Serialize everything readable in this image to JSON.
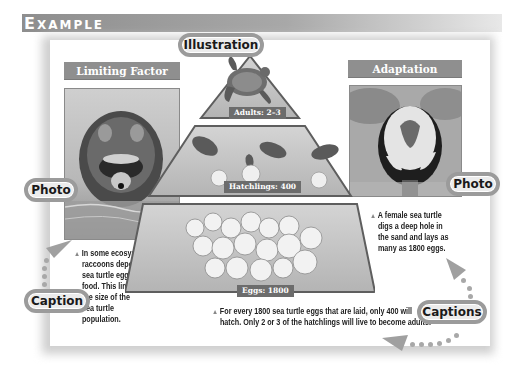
{
  "header": {
    "title_first": "E",
    "title_rest": "XAMPLE"
  },
  "callouts": {
    "illustration": "Illustration",
    "photo_left": "Photo",
    "photo_right": "Photo",
    "caption": "Caption",
    "captions": "Captions"
  },
  "panels": {
    "left": {
      "label": "Limiting Factor",
      "image": "raccoon-photo",
      "caption_lines": [
        "In some ecosystems,",
        "raccoons depend on",
        "sea turtle eggs for",
        "food. This limits",
        "the size of the",
        "sea turtle",
        "population."
      ]
    },
    "right": {
      "label": "Adaptation",
      "image": "sea-turtle-nesting-photo",
      "caption_lines": [
        "A female sea turtle",
        "digs a deep hole in",
        "the sand and lays as",
        "many as 1800 eggs."
      ]
    }
  },
  "pyramid": {
    "tiers": [
      {
        "label": "Adults: 2–3",
        "image": "adult-turtle"
      },
      {
        "label": "Hatchlings: 400",
        "image": "hatchling-turtles"
      },
      {
        "label": "Eggs: 1800",
        "image": "turtle-eggs"
      }
    ],
    "caption_lines": [
      "For every 1800 sea turtle eggs that are laid, only 400 will",
      "hatch. Only 2 or 3 of the hatchlings will live to become adults."
    ]
  },
  "colors": {
    "header_band": "#8e8e8e",
    "pill_border": "#9b9b9b",
    "label_bar": "#8f8f8f",
    "tier_label": "#6c6c6c"
  }
}
